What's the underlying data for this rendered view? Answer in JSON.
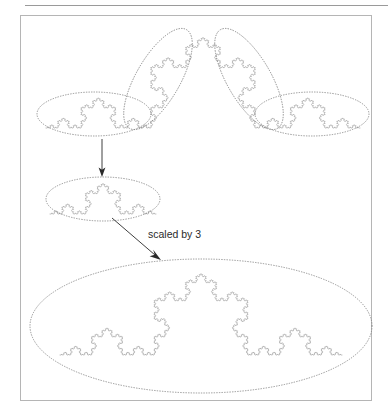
{
  "figure": {
    "background_color": "#ffffff",
    "curve_color": "#8d8d8d",
    "ellipse_color": "#7d7d7d",
    "arrow_color": "#2a2a2a",
    "frame_color": "#b5b5b5",
    "rule_color": "#9a9a9a"
  },
  "annotations": {
    "scale_label": "scaled by 3"
  },
  "chart_data": {
    "type": "line",
    "xlabel": "",
    "ylabel": "",
    "grid": false,
    "legend": null,
    "series": [
      {
        "name": "top-koch-curve",
        "role": "original",
        "iteration_depth": 5,
        "segment_count": 4,
        "endpoints": [
          [
            46,
            128
          ],
          [
            360,
            128
          ]
        ],
        "apex": [
          203,
          33
        ]
      },
      {
        "name": "extracted-sub-copy",
        "role": "one-quarter-piece",
        "iteration_depth": 4,
        "endpoints": [
          [
            50,
            214
          ],
          [
            156,
            214
          ]
        ]
      },
      {
        "name": "bottom-koch-curve",
        "role": "scaled-result",
        "iteration_depth": 5,
        "endpoints": [
          [
            60,
            355
          ],
          [
            342,
            355
          ]
        ]
      }
    ],
    "grouping_ellipses": [
      {
        "name": "top-left-group",
        "cx": 94,
        "cy": 114,
        "rx": 57,
        "ry": 22,
        "rotation_deg": 0
      },
      {
        "name": "top-middle-left-group",
        "cx": 158,
        "cy": 79,
        "rx": 57,
        "ry": 22,
        "rotation_deg": -60
      },
      {
        "name": "top-middle-right-group",
        "cx": 249,
        "cy": 79,
        "rx": 57,
        "ry": 22,
        "rotation_deg": 60
      },
      {
        "name": "top-right-group",
        "cx": 312,
        "cy": 114,
        "rx": 57,
        "ry": 22,
        "rotation_deg": 0
      },
      {
        "name": "extracted-group",
        "cx": 103,
        "cy": 199,
        "rx": 57,
        "ry": 22,
        "rotation_deg": 0
      },
      {
        "name": "scaled-group",
        "cx": 201,
        "cy": 326,
        "rx": 171,
        "ry": 67,
        "rotation_deg": 0
      }
    ],
    "arrows": [
      {
        "name": "extract-arrow",
        "from": [
          102,
          139
        ],
        "to": [
          102,
          176
        ],
        "label": null
      },
      {
        "name": "scale-arrow",
        "from": [
          112,
          218
        ],
        "to": [
          160,
          259
        ],
        "label": "scaled by 3"
      }
    ],
    "scale_factor": 3,
    "sub_copies": 4,
    "fractal_dimension": 1.2619
  }
}
